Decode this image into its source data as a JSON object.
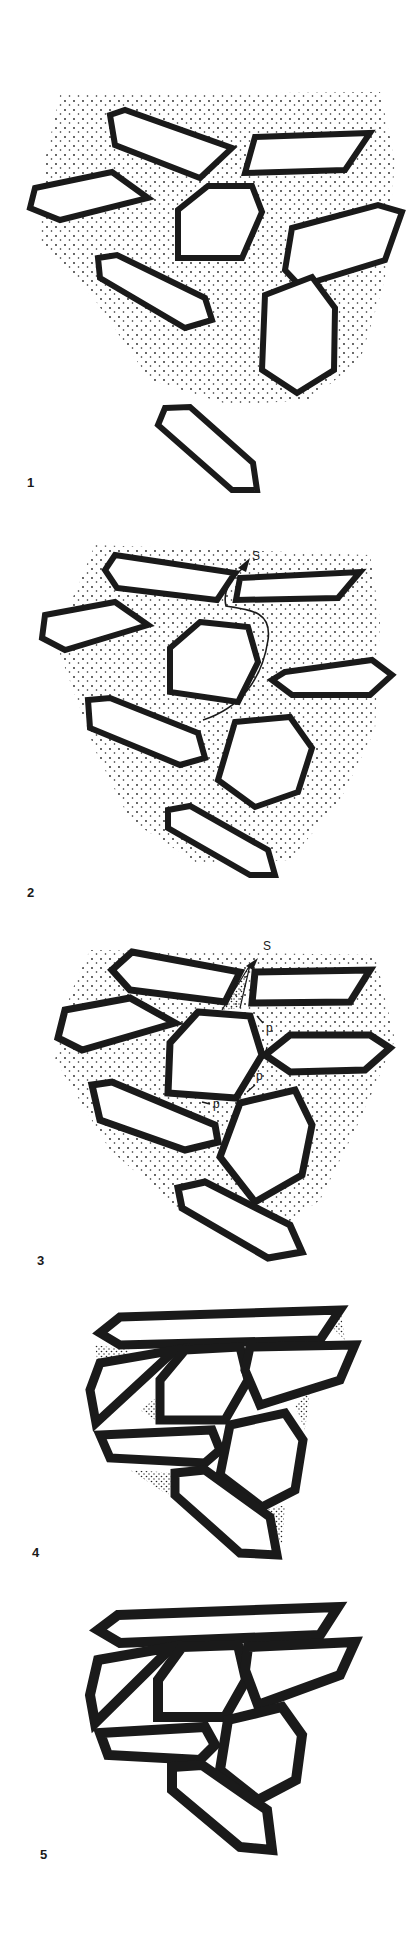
{
  "figure": {
    "stroke_color": "#1a1a1a",
    "background": "#ffffff",
    "dot_color": "#222222"
  },
  "panels": [
    {
      "number": "1",
      "annotations": []
    },
    {
      "number": "2",
      "annotations": [
        {
          "text": "S"
        }
      ]
    },
    {
      "number": "3",
      "annotations": [
        {
          "text": "S"
        },
        {
          "text": "p"
        },
        {
          "text": "p"
        },
        {
          "text": "p"
        }
      ]
    },
    {
      "number": "4",
      "annotations": []
    },
    {
      "number": "5",
      "annotations": []
    }
  ]
}
